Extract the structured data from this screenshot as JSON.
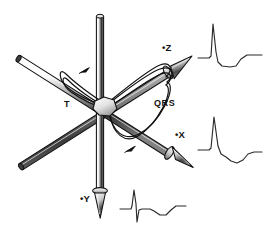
{
  "figure": {
    "background_color": "#ffffff",
    "line_color": "#111111",
    "shade_light": "#ffffff",
    "shade_mid": "#a8a8a8",
    "shade_dark": "#2b2b2b",
    "width": 266,
    "height": 235
  },
  "axes": [
    {
      "id": "z",
      "label": "•Z",
      "label_x": 162,
      "label_y": 51,
      "direction": "upper-right",
      "has_arrowhead": true,
      "tip_x": 189,
      "tip_y": 62,
      "tail_x": 20,
      "tail_y": 160
    },
    {
      "id": "x",
      "label": "•X",
      "label_x": 175,
      "label_y": 138,
      "direction": "lower-right",
      "has_arrowhead": true,
      "tip_x": 190,
      "tip_y": 164,
      "tail_x": 21,
      "tail_y": 58
    },
    {
      "id": "y",
      "label": "•Y",
      "label_x": 80,
      "label_y": 202,
      "direction": "down",
      "has_arrowhead": true,
      "tip_x": 101,
      "tip_y": 216,
      "tail_x": 100,
      "tail_y": 15
    }
  ],
  "loops": [
    {
      "id": "qrs",
      "label": "QRS",
      "label_x": 154,
      "label_y": 106,
      "description": "large heart-shaped spatial QRS vector loop",
      "direction_marker": true
    },
    {
      "id": "t",
      "label": "T",
      "label_x": 64,
      "label_y": 107,
      "description": "small teardrop spatial T vector loop",
      "direction_marker": true
    }
  ],
  "waveforms": [
    {
      "id": "ecg-z",
      "name": "lead-z-trace",
      "x": 198,
      "y": 18,
      "width": 64,
      "height": 58,
      "points": "0,40 7,40 11,40 13,38 15,6 18,34 20,44 24,48 32,49 38,48 43,41 49,37 58,37 64,37",
      "description": "tall R wave, small S dip, broad upright T wave"
    },
    {
      "id": "ecg-x",
      "name": "lead-x-trace",
      "x": 198,
      "y": 112,
      "width": 64,
      "height": 60,
      "points": "0,38 8,38 11,38 13,36 16,5 20,34 23,42 28,45 33,49 39,51 45,48 50,42 56,40 64,40",
      "description": "tall narrow R wave followed by negative then recovering T"
    },
    {
      "id": "ecg-y",
      "name": "lead-y-trace",
      "x": 120,
      "y": 184,
      "width": 66,
      "height": 48,
      "points": "0,25 8,25 11,25 12,22 14,6 16,20 17,38 19,26 22,25 30,25 34,27 40,31 46,31 51,26 56,22 62,22 66,22",
      "description": "sharp R with deep S, shallow negative segment, upright T"
    }
  ]
}
